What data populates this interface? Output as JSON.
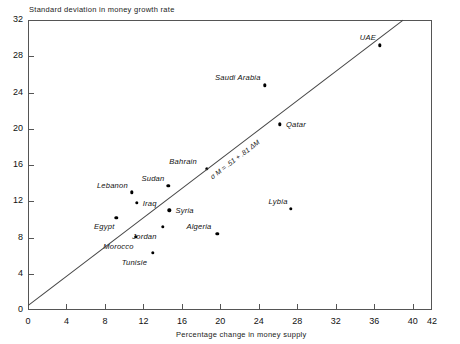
{
  "chart_data": {
    "type": "scatter",
    "title": "",
    "ylabel": "Standard deviation in money growth rate",
    "xlabel": "Percentage change in money supply",
    "xlim": [
      0,
      42
    ],
    "ylim": [
      0,
      32
    ],
    "xticks": [
      0,
      4,
      8,
      12,
      16,
      20,
      24,
      28,
      32,
      36,
      40,
      42
    ],
    "yticks": [
      0,
      4,
      8,
      12,
      16,
      20,
      24,
      28,
      32
    ],
    "grid": false,
    "legend": "none",
    "points": [
      {
        "label": "Egypt",
        "x": 9.2,
        "y": 10.2,
        "label_dx": -2,
        "label_dy": 9
      },
      {
        "label": "Lebanon",
        "x": 10.8,
        "y": 13.0,
        "label_dx": -4,
        "label_dy": -6
      },
      {
        "label": "Morocco",
        "x": 11.2,
        "y": 8.1,
        "label_dx": -2,
        "label_dy": 10
      },
      {
        "label": "Iraq",
        "x": 11.3,
        "y": 11.8,
        "label_dx": 6,
        "label_dy": 1
      },
      {
        "label": "Tunisie",
        "x": 13.0,
        "y": 6.3,
        "label_dx": -6,
        "label_dy": 10
      },
      {
        "label": "Jordan",
        "x": 14.0,
        "y": 9.2,
        "label_dx": -6,
        "label_dy": 10
      },
      {
        "label": "Sudan",
        "x": 14.6,
        "y": 13.7,
        "label_dx": -4,
        "label_dy": -7
      },
      {
        "label": "Syria",
        "x": 14.7,
        "y": 11.0,
        "label_dx": 6,
        "label_dy": 1
      },
      {
        "label": "Bahrain",
        "x": 18.6,
        "y": 15.6,
        "label_dx": -10,
        "label_dy": -7
      },
      {
        "label": "Algeria",
        "x": 19.7,
        "y": 8.4,
        "label_dx": -6,
        "label_dy": -7
      },
      {
        "label": "Saudi Arabia",
        "x": 24.6,
        "y": 24.8,
        "label_dx": -4,
        "label_dy": -7
      },
      {
        "label": "Qatar",
        "x": 26.2,
        "y": 20.5,
        "label_dx": 6,
        "label_dy": 1
      },
      {
        "label": "Lybia",
        "x": 27.3,
        "y": 11.2,
        "label_dx": -3,
        "label_dy": -7
      },
      {
        "label": "UAE",
        "x": 36.6,
        "y": 29.2,
        "label_dx": -4,
        "label_dy": -7
      }
    ],
    "trendline": {
      "equation": "σ M = .51 + .81 ΔM",
      "x0": 0.0,
      "y0": 0.5,
      "x1": 39.0,
      "y1": 32.0
    }
  }
}
